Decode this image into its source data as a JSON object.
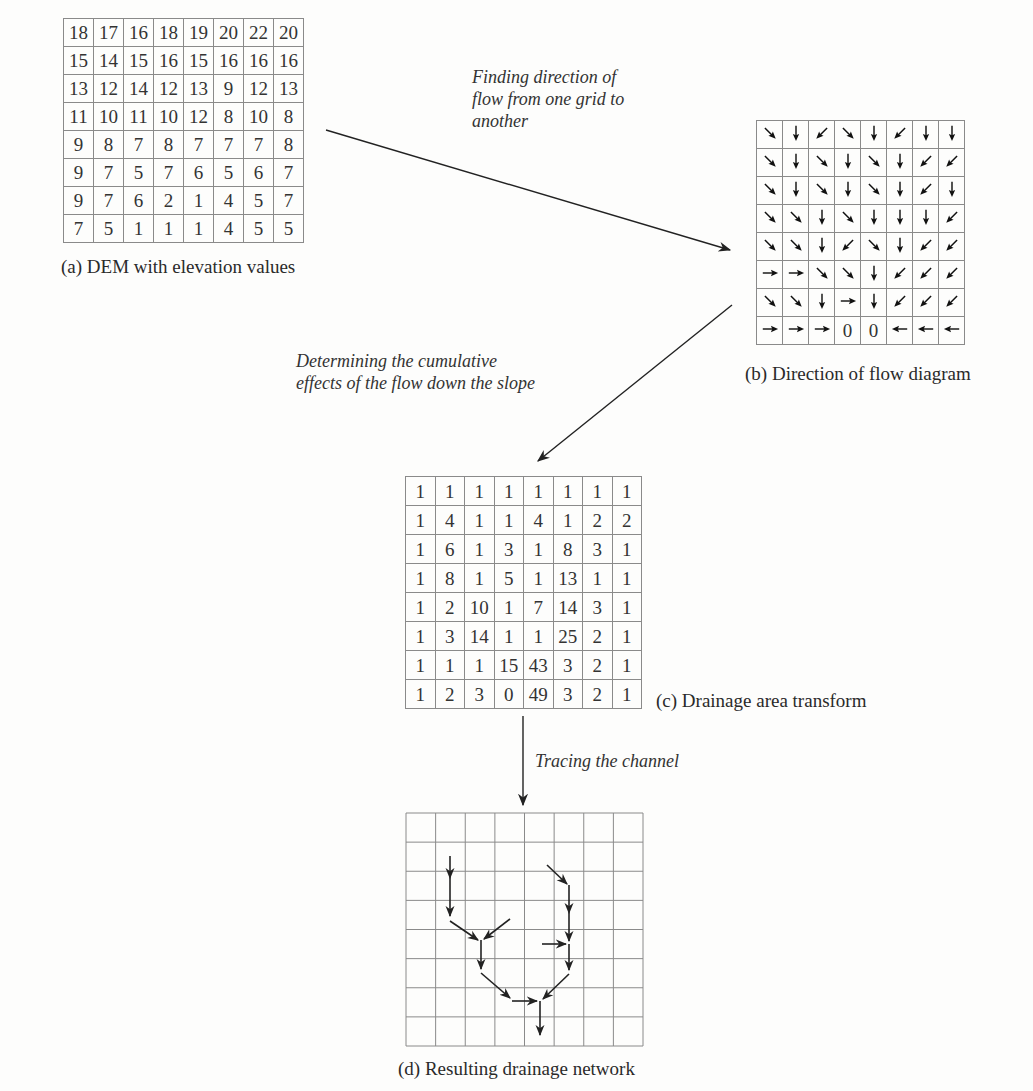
{
  "panels": {
    "a": {
      "caption": "(a) DEM with elevation values",
      "rows": [
        [
          18,
          17,
          16,
          18,
          19,
          20,
          22,
          20
        ],
        [
          15,
          14,
          15,
          16,
          15,
          16,
          16,
          16
        ],
        [
          13,
          12,
          14,
          12,
          13,
          9,
          12,
          13
        ],
        [
          11,
          10,
          11,
          10,
          12,
          8,
          10,
          8
        ],
        [
          9,
          8,
          7,
          8,
          7,
          7,
          7,
          8
        ],
        [
          9,
          7,
          5,
          7,
          6,
          5,
          6,
          7
        ],
        [
          9,
          7,
          6,
          2,
          1,
          4,
          5,
          7
        ],
        [
          7,
          5,
          1,
          1,
          1,
          4,
          5,
          5
        ]
      ]
    },
    "b": {
      "caption": "(b) Direction of flow diagram",
      "rows": [
        [
          "SE",
          "S",
          "SW",
          "SE",
          "S",
          "SW",
          "S",
          "S"
        ],
        [
          "SE",
          "S",
          "SE",
          "S",
          "SE",
          "S",
          "SW",
          "SW"
        ],
        [
          "SE",
          "S",
          "SE",
          "S",
          "SE",
          "S",
          "SW",
          "S"
        ],
        [
          "SE",
          "SE",
          "S",
          "SE",
          "S",
          "S",
          "S",
          "SW"
        ],
        [
          "SE",
          "SE",
          "S",
          "SW",
          "SE",
          "S",
          "SW",
          "SW"
        ],
        [
          "E",
          "E",
          "SE",
          "SE",
          "S",
          "SW",
          "SW",
          "SW"
        ],
        [
          "SE",
          "SE",
          "S",
          "E",
          "S",
          "SW",
          "SW",
          "SW"
        ],
        [
          "E",
          "E",
          "E",
          "0",
          "0",
          "W",
          "W",
          "W"
        ]
      ]
    },
    "c": {
      "caption": "(c) Drainage area transform",
      "rows": [
        [
          1,
          1,
          1,
          1,
          1,
          1,
          1,
          1
        ],
        [
          1,
          4,
          1,
          1,
          4,
          1,
          2,
          2
        ],
        [
          1,
          6,
          1,
          3,
          1,
          8,
          3,
          1
        ],
        [
          1,
          8,
          1,
          5,
          1,
          13,
          1,
          1
        ],
        [
          1,
          2,
          10,
          1,
          7,
          14,
          3,
          1
        ],
        [
          1,
          3,
          14,
          1,
          1,
          25,
          2,
          1
        ],
        [
          1,
          1,
          1,
          15,
          43,
          3,
          2,
          1
        ],
        [
          1,
          2,
          3,
          0,
          49,
          3,
          2,
          1
        ]
      ]
    },
    "d": {
      "caption": "(d) Resulting drainage network",
      "grid_size": 8
    }
  },
  "transitions": {
    "a_to_b": "Finding direction of flow from one grid to another",
    "a_to_b_lines": [
      "Finding direction of",
      "flow from one grid to",
      "another"
    ],
    "b_to_c_lines": [
      "Determining the cumulative",
      "effects of the flow down the slope"
    ],
    "c_to_d": "Tracing the channel"
  },
  "direction_glyphs": {
    "N": "↑",
    "S": "↓",
    "E": "→",
    "W": "←",
    "SE": "↘",
    "SW": "↙",
    "NE": "↗",
    "NW": "↖",
    "0": "0"
  }
}
